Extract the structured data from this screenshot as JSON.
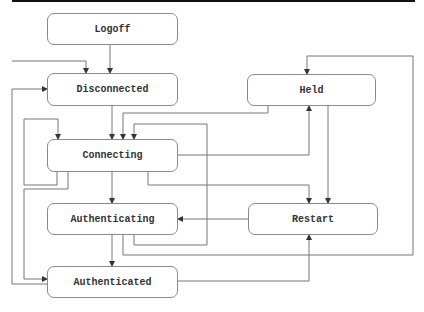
{
  "diagram": {
    "type": "state-transition",
    "nodes": [
      {
        "id": "logoff",
        "label": "Logoff"
      },
      {
        "id": "disconnected",
        "label": "Disconnected"
      },
      {
        "id": "held",
        "label": "Held"
      },
      {
        "id": "connecting",
        "label": "Connecting"
      },
      {
        "id": "authenticating",
        "label": "Authenticating"
      },
      {
        "id": "restart",
        "label": "Restart"
      },
      {
        "id": "authenticated",
        "label": "Authenticated"
      }
    ],
    "edges": [
      {
        "from": "external",
        "to": "disconnected"
      },
      {
        "from": "logoff",
        "to": "disconnected"
      },
      {
        "from": "disconnected",
        "to": "connecting"
      },
      {
        "from": "connecting",
        "to": "connecting"
      },
      {
        "from": "connecting",
        "to": "authenticating"
      },
      {
        "from": "connecting",
        "to": "held"
      },
      {
        "from": "connecting",
        "to": "restart"
      },
      {
        "from": "connecting",
        "to": "authenticated"
      },
      {
        "from": "held",
        "to": "connecting"
      },
      {
        "from": "held",
        "to": "restart"
      },
      {
        "from": "authenticating",
        "to": "authenticated"
      },
      {
        "from": "authenticating",
        "to": "connecting"
      },
      {
        "from": "authenticating",
        "to": "held"
      },
      {
        "from": "restart",
        "to": "authenticating"
      },
      {
        "from": "authenticated",
        "to": "restart"
      },
      {
        "from": "authenticated",
        "to": "disconnected"
      }
    ],
    "colors": {
      "line": "#666666",
      "border": "#8a8a8a",
      "text": "#333333"
    }
  }
}
